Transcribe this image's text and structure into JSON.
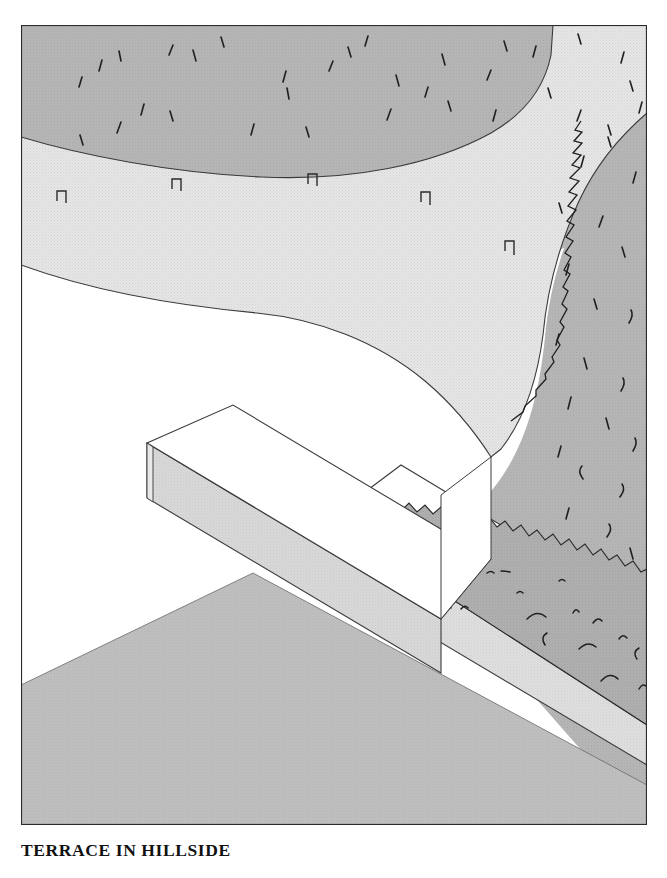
{
  "figure": {
    "caption": "TERRACE IN HILLSIDE",
    "alt_name": "terrace-in-hillside-illustration",
    "style": "line-drawing-halftone",
    "frame": {
      "x": 21,
      "y": 25,
      "width": 626,
      "height": 800
    },
    "colors": {
      "paper": "#ffffff",
      "hillside_upper": "#b4b4b4",
      "hillside_right": "#b0b0b0",
      "terrace_deck": "#e3e3e3",
      "wall_top": "#ffffff",
      "wall_face": "#d6d6d6",
      "wall_face_right": "#dcdcdc",
      "ground_lower": "#bdbdbd",
      "grass_strip": "#adadad",
      "outline": "#2b2b2b",
      "caption_text": "#111111"
    },
    "regions": [
      {
        "name": "upper-hillside-slope",
        "label": "hillside above terrace",
        "fill": "#b4b4b4",
        "texture": "sparse-grass-ticks"
      },
      {
        "name": "terrace-deck",
        "label": "curved terrace platform",
        "fill": "#e3e3e3",
        "texture": "fine-halftone-dots"
      },
      {
        "name": "right-hillside",
        "label": "hillside bank to the right",
        "fill": "#b0b0b0",
        "texture": "sparse-grass-ticks"
      },
      {
        "name": "retaining-wall-left",
        "label": "retaining wall running to lower left",
        "fill": "#d6d6d6"
      },
      {
        "name": "retaining-wall-right",
        "label": "retaining wall running to lower right",
        "fill": "#dcdcdc"
      },
      {
        "name": "grass-strip",
        "label": "planted grass strip in trough",
        "fill": "#adadad",
        "texture": "tufted-grass"
      },
      {
        "name": "lower-ground",
        "label": "ground plane below terrace",
        "fill": "#bdbdbd"
      }
    ],
    "edge_markers": {
      "name": "terrace-edge-post",
      "label": "small notch markers along terrace edge",
      "count": 5,
      "positions": [
        {
          "x": 40,
          "y": 178
        },
        {
          "x": 155,
          "y": 166
        },
        {
          "x": 291,
          "y": 161
        },
        {
          "x": 404,
          "y": 179
        },
        {
          "x": 488,
          "y": 228
        }
      ]
    },
    "grass_ticks_upper": [
      [
        78,
        46
      ],
      [
        100,
        36
      ],
      [
        148,
        30
      ],
      [
        175,
        36
      ],
      [
        58,
        62
      ],
      [
        203,
        18
      ],
      [
        262,
        57
      ],
      [
        268,
        72
      ],
      [
        308,
        46
      ],
      [
        330,
        30
      ],
      [
        344,
        19
      ],
      [
        378,
        61
      ],
      [
        404,
        72
      ],
      [
        424,
        40
      ],
      [
        466,
        55
      ],
      [
        486,
        24
      ],
      [
        512,
        30
      ],
      [
        560,
        17
      ],
      [
        600,
        38
      ],
      [
        612,
        66
      ],
      [
        120,
        90
      ],
      [
        152,
        96
      ],
      [
        96,
        108
      ],
      [
        62,
        120
      ],
      [
        230,
        110
      ],
      [
        288,
        112
      ],
      [
        366,
        95
      ],
      [
        430,
        86
      ],
      [
        472,
        96
      ],
      [
        530,
        73
      ],
      [
        556,
        96
      ],
      [
        590,
        110
      ],
      [
        618,
        88
      ]
    ],
    "grass_ticks_right": [
      [
        560,
        140
      ],
      [
        590,
        120
      ],
      [
        612,
        156
      ],
      [
        540,
        186
      ],
      [
        578,
        200
      ],
      [
        604,
        230
      ],
      [
        544,
        248
      ],
      [
        576,
        282
      ],
      [
        608,
        296
      ],
      [
        534,
        318
      ],
      [
        566,
        342
      ],
      [
        600,
        364
      ],
      [
        546,
        382
      ],
      [
        588,
        402
      ],
      [
        612,
        424
      ],
      [
        536,
        430
      ],
      [
        562,
        452
      ],
      [
        598,
        470
      ],
      [
        544,
        492
      ]
    ]
  }
}
